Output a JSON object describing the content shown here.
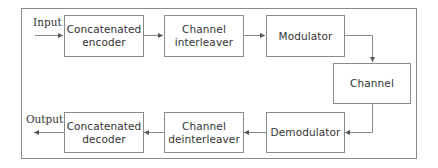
{
  "diagram": {
    "type": "block-diagram",
    "input_label": "Input",
    "output_label": "Output",
    "blocks": {
      "concat_encoder": {
        "line1": "Concatenated",
        "line2": "encoder"
      },
      "interleaver": {
        "line1": "Channel",
        "line2": "interleaver"
      },
      "modulator": {
        "line1": "Modulator"
      },
      "channel": {
        "line1": "Channel"
      },
      "demodulator": {
        "line1": "Demodulator"
      },
      "deinterleaver": {
        "line1": "Channel",
        "line2": "deinterleaver"
      },
      "concat_decoder": {
        "line1": "Concatenated",
        "line2": "decoder"
      }
    },
    "flow": [
      "Input",
      "Concatenated encoder",
      "Channel interleaver",
      "Modulator",
      "Channel",
      "Demodulator",
      "Channel deinterleaver",
      "Concatenated decoder",
      "Output"
    ],
    "colors": {
      "line": "#8a8a8a",
      "text": "#333333",
      "background": "#ffffff"
    }
  }
}
